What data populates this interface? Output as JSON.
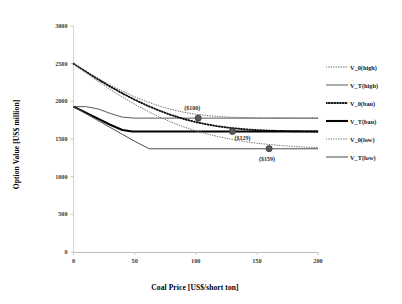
{
  "chart_data": {
    "type": "line",
    "title": "",
    "xlabel": "Coal Price [US$/short ton]",
    "ylabel": "Option Value [US$ million]",
    "xlim": [
      0,
      200
    ],
    "ylim": [
      0,
      3000
    ],
    "xticks": [
      "0",
      "50",
      "100",
      "150",
      "200"
    ],
    "yticks": [
      "0",
      "500",
      "1000",
      "1500",
      "2000",
      "2500",
      "3000"
    ],
    "grid": false,
    "legend_position": "right",
    "series": [
      {
        "name": "V_0(high)",
        "style": "fine-dotted",
        "color": "#6f6f6f",
        "x": [
          0,
          10,
          20,
          30,
          40,
          50,
          60,
          70,
          80,
          90,
          100,
          110,
          120,
          130,
          140,
          150,
          160,
          170,
          180,
          190,
          200
        ],
        "y": [
          2500,
          2400,
          2305,
          2215,
          2135,
          2060,
          1995,
          1938,
          1892,
          1856,
          1828,
          1810,
          1797,
          1788,
          1783,
          1780,
          1779,
          1778,
          1778,
          1777,
          1777
        ]
      },
      {
        "name": "V_T(high)",
        "style": "solid-thin",
        "color": "#5a5a5a",
        "x": [
          0,
          10,
          20,
          30,
          40,
          50,
          60,
          70,
          100,
          150,
          200
        ],
        "y": [
          1930,
          1930,
          1900,
          1840,
          1790,
          1777,
          1777,
          1777,
          1777,
          1777,
          1777
        ]
      },
      {
        "name": "V_0(bau)",
        "style": "bold-dotted",
        "color": "#111111",
        "x": [
          0,
          10,
          20,
          30,
          40,
          50,
          60,
          70,
          80,
          90,
          100,
          110,
          120,
          130,
          140,
          150,
          160,
          170,
          180,
          190,
          200
        ],
        "y": [
          2500,
          2395,
          2293,
          2196,
          2106,
          2022,
          1946,
          1878,
          1818,
          1767,
          1725,
          1691,
          1664,
          1644,
          1629,
          1618,
          1611,
          1606,
          1603,
          1601,
          1600
        ]
      },
      {
        "name": "V_T(bau)",
        "style": "solid-bold",
        "color": "#000000",
        "x": [
          0,
          10,
          20,
          30,
          40,
          48,
          60,
          100,
          150,
          200
        ],
        "y": [
          1930,
          1850,
          1770,
          1690,
          1620,
          1600,
          1600,
          1600,
          1600,
          1600
        ]
      },
      {
        "name": "V_0(low)",
        "style": "fine-dotted",
        "color": "#757575",
        "x": [
          0,
          10,
          20,
          30,
          40,
          50,
          60,
          70,
          80,
          90,
          100,
          110,
          120,
          130,
          140,
          150,
          160,
          170,
          180,
          190,
          200
        ],
        "y": [
          2500,
          2380,
          2266,
          2158,
          2056,
          1961,
          1874,
          1795,
          1724,
          1662,
          1609,
          1564,
          1526,
          1493,
          1466,
          1444,
          1427,
          1413,
          1402,
          1393,
          1386
        ]
      },
      {
        "name": "V_T(low)",
        "style": "solid-thin",
        "color": "#4a4a4a",
        "x": [
          0,
          10,
          20,
          30,
          40,
          50,
          62,
          70,
          100,
          150,
          200
        ],
        "y": [
          1930,
          1838,
          1746,
          1654,
          1562,
          1470,
          1370,
          1370,
          1370,
          1370,
          1370
        ]
      }
    ],
    "markers": [
      {
        "label": "($100)",
        "x": 102,
        "y": 1777,
        "series": "V_T(high)"
      },
      {
        "label": "($129)",
        "x": 130,
        "y": 1600,
        "series": "V_T(bau)"
      },
      {
        "label": "($159)",
        "x": 160,
        "y": 1372,
        "series": "V_T(low)"
      }
    ],
    "legend_entries": [
      {
        "label": "V_0(high)",
        "style": "fine-dotted"
      },
      {
        "label": "V_T(high)",
        "style": "solid-thin"
      },
      {
        "label": "V_0(bau)",
        "style": "bold-dotted"
      },
      {
        "label": "V_T(bau)",
        "style": "solid-bold"
      },
      {
        "label": "V_0(low)",
        "style": "fine-dotted"
      },
      {
        "label": "V_T(low)",
        "style": "solid-thin"
      }
    ]
  }
}
